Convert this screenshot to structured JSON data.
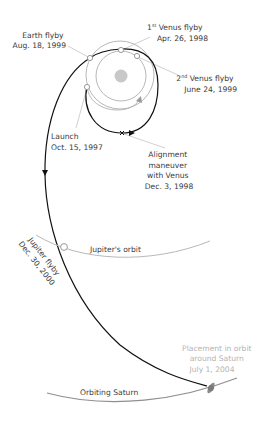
{
  "diagram": {
    "labels": {
      "earth_flyby": {
        "line1": "Earth flyby",
        "line2": "Aug. 18, 1999"
      },
      "venus_flyby_1": {
        "ordinal": "1",
        "suffix": "st",
        "line1_rest": " Venus flyby",
        "line2": "Apr. 26, 1998"
      },
      "venus_flyby_2": {
        "ordinal": "2",
        "suffix": "nd",
        "line1_rest": " Venus flyby",
        "line2": "June 24, 1999"
      },
      "launch": {
        "line1": "Launch",
        "line2": "Oct. 15, 1997"
      },
      "alignment": {
        "line1": "Alignment",
        "line2": "maneuver",
        "line3": "with Venus",
        "line4": "Dec. 3, 1998"
      },
      "jupiter_orbit": "Jupiter's orbit",
      "jupiter_flyby": {
        "line1": "Jupiter flyby",
        "line2": "Dec. 30, 2000"
      },
      "saturn_arrival": {
        "line1": "Placement in orbit",
        "line2": "around Saturn",
        "line3": "July 1, 2004"
      },
      "saturn_orbit": "Orbiting Saturn"
    },
    "colors": {
      "trajectory": "#111111",
      "orbit": "#b8b8b8",
      "leader": "#c4c4c4",
      "sun": "#c8c8c8",
      "saturn": "#8a8a8a",
      "label": "#3a3a3a",
      "label_light": "#b4b4b4"
    }
  }
}
